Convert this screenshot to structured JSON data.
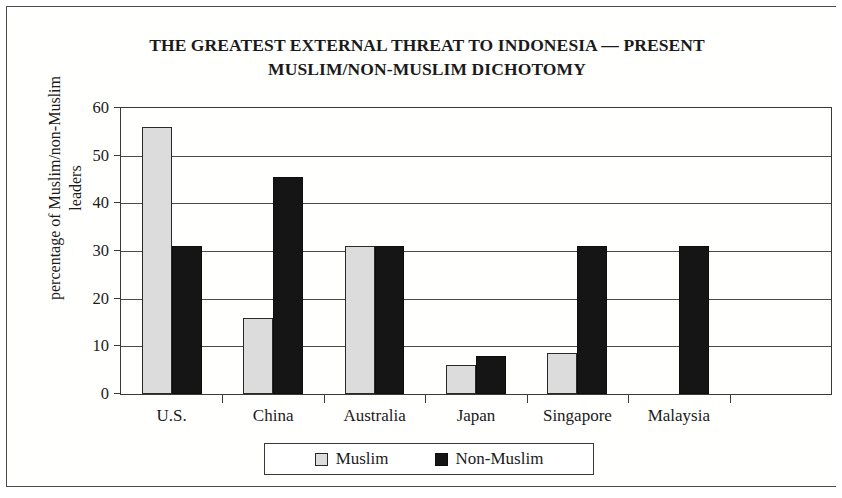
{
  "chart_data": {
    "type": "bar",
    "title": "THE GREATEST EXTERNAL THREAT TO INDONESIA — PRESENT MUSLIM/NON-MUSLIM DICHOTOMY",
    "title_line1": "THE GREATEST EXTERNAL THREAT TO INDONESIA — PRESENT",
    "title_line2": "MUSLIM/NON-MUSLIM DICHOTOMY",
    "xlabel": "",
    "ylabel": "percentage of Muslim/non-Muslim leaders",
    "ylabel_line1": "percentage of Muslim/non-Muslim",
    "ylabel_line2": "leaders",
    "categories": [
      "U.S.",
      "China",
      "Australia",
      "Japan",
      "Singapore",
      "Malaysia"
    ],
    "series": [
      {
        "name": "Muslim",
        "color": "#dcdcdc",
        "values": [
          56,
          16,
          31,
          6,
          8.5,
          0
        ]
      },
      {
        "name": "Non-Muslim",
        "color": "#151515",
        "values": [
          31,
          45.5,
          31,
          8,
          31,
          31
        ]
      }
    ],
    "ylim": [
      0,
      60
    ],
    "yticks": [
      0,
      10,
      20,
      30,
      40,
      50,
      60
    ],
    "ytick_labels": [
      "0",
      "10",
      "20",
      "30",
      "40",
      "50",
      "60"
    ],
    "grid": true,
    "legend_position": "bottom",
    "legend_entries": [
      "Muslim",
      "Non-Muslim"
    ]
  }
}
